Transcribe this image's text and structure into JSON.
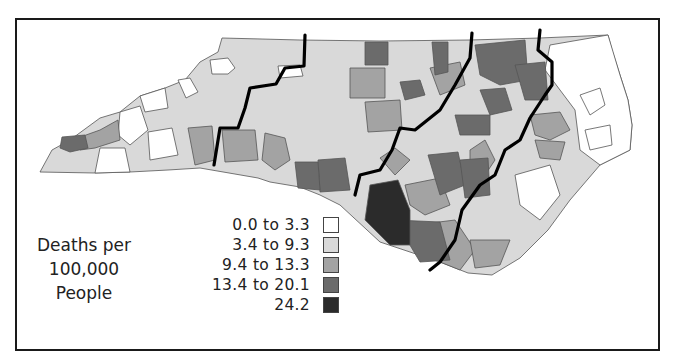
{
  "map": {
    "region": "North Carolina",
    "subject": "Deaths per 100,000 People by county",
    "divider_lines": 4
  },
  "legend": {
    "title_lines": [
      "Deaths per",
      "100,000",
      "People"
    ],
    "items": [
      {
        "label": "0.0 to 3.3",
        "color": "#ffffff"
      },
      {
        "label": "3.4 to 9.3",
        "color": "#d9d9d9"
      },
      {
        "label": "9.4 to 13.3",
        "color": "#a3a3a3"
      },
      {
        "label": "13.4 to 20.1",
        "color": "#6b6b6b"
      },
      {
        "label": "24.2",
        "color": "#2b2b2b"
      }
    ]
  },
  "colors": {
    "border": "#1a1a1a",
    "county_stroke": "#555555",
    "region_line": "#000000"
  }
}
